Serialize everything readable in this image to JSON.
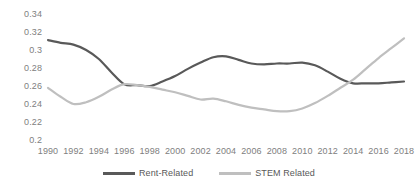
{
  "chart_data": {
    "type": "line",
    "title": "",
    "subtitle": "",
    "xlabel": "",
    "ylabel": "",
    "grid": false,
    "legend_position": "bottom",
    "xlim": [
      1990,
      2018
    ],
    "ylim": [
      0.2,
      0.34
    ],
    "ytick_labels": [
      "0.34",
      "0.32",
      "0.3",
      "0.28",
      "0.26",
      "0.24",
      "0.22",
      "0.2"
    ],
    "ytick_values": [
      0.34,
      0.32,
      0.3,
      0.28,
      0.26,
      0.24,
      0.22,
      0.2
    ],
    "xtick_labels": [
      "1990",
      "1992",
      "1994",
      "1996",
      "1998",
      "2000",
      "2002",
      "2004",
      "2006",
      "2008",
      "2010",
      "2012",
      "2014",
      "2016",
      "2018"
    ],
    "x": [
      1990,
      1991,
      1992,
      1993,
      1994,
      1995,
      1996,
      1997,
      1998,
      1999,
      2000,
      2001,
      2002,
      2003,
      2004,
      2005,
      2006,
      2007,
      2008,
      2009,
      2010,
      2011,
      2012,
      2013,
      2014,
      2015,
      2016,
      2017,
      2018
    ],
    "series": [
      {
        "name": "Rent-Related",
        "color": "#595959",
        "values": [
          0.311,
          0.308,
          0.306,
          0.3,
          0.29,
          0.275,
          0.262,
          0.261,
          0.26,
          0.265,
          0.271,
          0.279,
          0.286,
          0.292,
          0.293,
          0.289,
          0.285,
          0.284,
          0.285,
          0.285,
          0.286,
          0.283,
          0.276,
          0.268,
          0.263,
          0.263,
          0.263,
          0.264,
          0.265
        ]
      },
      {
        "name": "STEM Related",
        "color": "#bfbfbf",
        "values": [
          0.258,
          0.248,
          0.24,
          0.242,
          0.248,
          0.256,
          0.262,
          0.261,
          0.259,
          0.256,
          0.253,
          0.249,
          0.245,
          0.246,
          0.243,
          0.239,
          0.236,
          0.234,
          0.232,
          0.232,
          0.235,
          0.241,
          0.249,
          0.258,
          0.267,
          0.279,
          0.291,
          0.302,
          0.313
        ]
      }
    ]
  },
  "legend": {
    "items": [
      {
        "label": "Rent-Related",
        "color": "#595959"
      },
      {
        "label": "STEM Related",
        "color": "#bfbfbf"
      }
    ]
  }
}
